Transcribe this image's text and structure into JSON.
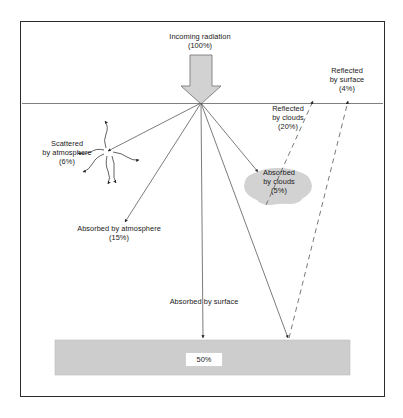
{
  "diagram": {
    "frame_color": "#2b2b2b",
    "ground_color": "#cdcdcd",
    "cloud_color": "#d2d2d2",
    "arrow_color": "#d0d0d0",
    "ray_color": "#5a5a5a"
  },
  "labels": {
    "incoming": {
      "line1": "Incoming radiation",
      "line2": "(100%)"
    },
    "reflected_surface": {
      "line1": "Reflected",
      "line2": "by surface",
      "line3": "(4%)"
    },
    "reflected_clouds": {
      "line1": "Reflected",
      "line2": "by clouds",
      "line3": "(20%)"
    },
    "scattered_atmosphere": {
      "line1": "Scattered",
      "line2": "by atmosphere",
      "line3": "(6%)"
    },
    "absorbed_atmosphere": {
      "line1": "Absorbed by atmosphere",
      "line2": "(15%)"
    },
    "absorbed_clouds": {
      "line1": "Absorbed",
      "line2": "by clouds",
      "line3": "(5%)"
    },
    "absorbed_surface": {
      "line1": "Absorbed by surface"
    },
    "surface_value": "50%"
  },
  "values": {
    "incoming_pct": 100,
    "reflected_by_clouds_pct": 20,
    "reflected_by_surface_pct": 4,
    "scattered_by_atmosphere_pct": 6,
    "absorbed_by_atmosphere_pct": 15,
    "absorbed_by_clouds_pct": 5,
    "absorbed_by_surface_pct": 50
  }
}
